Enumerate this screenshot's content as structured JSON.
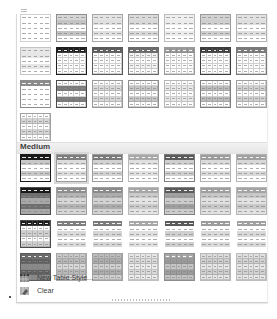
{
  "gallery": {
    "sections": [
      {
        "name": "Light",
        "label": "",
        "top": 0
      },
      {
        "name": "Medium",
        "label": "Medium",
        "top": 127
      }
    ],
    "light_rows": [
      [
        {
          "id": "light-1",
          "header": "#ffffff",
          "band": "#ffffff",
          "alt": "#ffffff",
          "border": "#d0d0d0",
          "bordered": false
        },
        {
          "id": "light-2",
          "header": "#d6d6d6",
          "band": "#c4c4c4",
          "alt": "#ffffff",
          "border": "#8c8c8c",
          "bordered": false
        },
        {
          "id": "light-3",
          "header": "#e4e4e4",
          "band": "#e0e0e0",
          "alt": "#ffffff",
          "border": "#a6a6a6",
          "bordered": false
        },
        {
          "id": "light-4",
          "header": "#dcdcdc",
          "band": "#d8d8d8",
          "alt": "#ffffff",
          "border": "#9a9a9a",
          "bordered": false
        },
        {
          "id": "light-5",
          "header": "#efefef",
          "band": "#ececec",
          "alt": "#ffffff",
          "border": "#bdbdbd",
          "bordered": false
        },
        {
          "id": "light-6",
          "header": "#d2d2d2",
          "band": "#cfcfcf",
          "alt": "#ffffff",
          "border": "#999999",
          "bordered": false
        },
        {
          "id": "light-7",
          "header": "#e2e2e2",
          "band": "#dedede",
          "alt": "#ffffff",
          "border": "#b0b0b0",
          "bordered": false
        }
      ],
      [
        {
          "id": "light-8",
          "header": "#e8e8e8",
          "band": "#e6e6e6",
          "alt": "#ffffff",
          "border": "#c4c4c4",
          "bordered": false
        },
        {
          "id": "light-9",
          "header": "#1e1e1e",
          "band": "#ffffff",
          "alt": "#ffffff",
          "border": "#1e1e1e",
          "bordered": true
        },
        {
          "id": "light-10",
          "header": "#5a5a5a",
          "band": "#ffffff",
          "alt": "#ffffff",
          "border": "#5a5a5a",
          "bordered": true
        },
        {
          "id": "light-11",
          "header": "#6a6a6a",
          "band": "#f3f3f3",
          "alt": "#ffffff",
          "border": "#6a6a6a",
          "bordered": true
        },
        {
          "id": "light-12",
          "header": "#9a9a9a",
          "band": "#ffffff",
          "alt": "#ffffff",
          "border": "#9a9a9a",
          "bordered": true
        },
        {
          "id": "light-13",
          "header": "#3c3c3c",
          "band": "#ffffff",
          "alt": "#ffffff",
          "border": "#3c3c3c",
          "bordered": true
        },
        {
          "id": "light-14",
          "header": "#7a7a7a",
          "band": "#ffffff",
          "alt": "#ffffff",
          "border": "#7a7a7a",
          "bordered": true
        }
      ],
      [
        {
          "id": "light-15",
          "header": "#8c8c8c",
          "band": "#ffffff",
          "alt": "#ffffff",
          "border": "#8c8c8c",
          "bordered": false
        },
        {
          "id": "light-16",
          "header": "#ffffff",
          "band": "#7c7c7c",
          "alt": "#ffffff",
          "border": "#4a4a4a",
          "bordered": true
        },
        {
          "id": "light-17",
          "header": "#ffffff",
          "band": "#d9d9d9",
          "alt": "#ffffff",
          "border": "#9a9a9a",
          "bordered": true
        },
        {
          "id": "light-18",
          "header": "#ffffff",
          "band": "#c8c8c8",
          "alt": "#ffffff",
          "border": "#8a8a8a",
          "bordered": true
        },
        {
          "id": "light-19",
          "header": "#ffffff",
          "band": "#e8e8e8",
          "alt": "#ffffff",
          "border": "#b5b5b5",
          "bordered": true
        },
        {
          "id": "light-20",
          "header": "#ffffff",
          "band": "#bdbdbd",
          "alt": "#ffffff",
          "border": "#7e7e7e",
          "bordered": true
        },
        {
          "id": "light-21",
          "header": "#ffffff",
          "band": "#d2d2d2",
          "alt": "#ffffff",
          "border": "#9e9e9e",
          "bordered": true
        }
      ],
      [
        {
          "id": "light-22",
          "header": "#ffffff",
          "band": "#d6d6d6",
          "alt": "#ffffff",
          "border": "#a0a0a0",
          "bordered": true
        }
      ]
    ],
    "medium_rows": [
      [
        {
          "id": "medium-1",
          "header": "#1a1a1a",
          "band": "#c8c8c8",
          "alt": "#ffffff",
          "border": "#1a1a1a",
          "bordered": false
        },
        {
          "id": "medium-2",
          "header": "#7e7e7e",
          "band": "#dcdcdc",
          "alt": "#ffffff",
          "border": "#9a9a9a",
          "bordered": false,
          "selected": true
        },
        {
          "id": "medium-3",
          "header": "#7a7a7a",
          "band": "#d2d2d2",
          "alt": "#ffffff",
          "border": "#9a9a9a",
          "bordered": false
        },
        {
          "id": "medium-4",
          "header": "#a8a8a8",
          "band": "#e0e0e0",
          "alt": "#ffffff",
          "border": "#b8b8b8",
          "bordered": false
        },
        {
          "id": "medium-5",
          "header": "#5a5a5a",
          "band": "#cfcfcf",
          "alt": "#ffffff",
          "border": "#7a7a7a",
          "bordered": false
        },
        {
          "id": "medium-6",
          "header": "#9c9c9c",
          "band": "#dadada",
          "alt": "#ffffff",
          "border": "#b0b0b0",
          "bordered": false
        },
        {
          "id": "medium-7",
          "header": "#a0a0a0",
          "band": "#d8d8d8",
          "alt": "#ffffff",
          "border": "#b4b4b4",
          "bordered": false
        }
      ],
      [
        {
          "id": "medium-8",
          "header": "#1a1a1a",
          "band": "#6e6e6e",
          "alt": "#a8a8a8",
          "border": "#4a4a4a",
          "bordered": false
        },
        {
          "id": "medium-9",
          "header": "#8e8e8e",
          "band": "#b4b4b4",
          "alt": "#d6d6d6",
          "border": "#a0a0a0",
          "bordered": false
        },
        {
          "id": "medium-10",
          "header": "#8a8a8a",
          "band": "#acacac",
          "alt": "#d2d2d2",
          "border": "#9c9c9c",
          "bordered": false
        },
        {
          "id": "medium-11",
          "header": "#a6a6a6",
          "band": "#cacaca",
          "alt": "#e4e4e4",
          "border": "#b8b8b8",
          "bordered": false
        },
        {
          "id": "medium-12",
          "header": "#5a5a5a",
          "band": "#a0a0a0",
          "alt": "#cccccc",
          "border": "#7e7e7e",
          "bordered": false
        },
        {
          "id": "medium-13",
          "header": "#9e9e9e",
          "band": "#c6c6c6",
          "alt": "#e0e0e0",
          "border": "#b2b2b2",
          "bordered": false
        },
        {
          "id": "medium-14",
          "header": "#a4a4a4",
          "band": "#c8c8c8",
          "alt": "#e2e2e2",
          "border": "#b6b6b6",
          "bordered": false
        }
      ],
      [
        {
          "id": "medium-15",
          "header": "#1a1a1a",
          "band": "#ffffff",
          "alt": "#d0d0d0",
          "border": "#4a4a4a",
          "bordered": true
        },
        {
          "id": "medium-16",
          "header": "#7e7e7e",
          "band": "#ffffff",
          "alt": "#dadada",
          "border": "#ffffff",
          "bordered": false
        },
        {
          "id": "medium-17",
          "header": "#7a7a7a",
          "band": "#ffffff",
          "alt": "#d6d6d6",
          "border": "#ffffff",
          "bordered": false
        },
        {
          "id": "medium-18",
          "header": "#a8a8a8",
          "band": "#ffffff",
          "alt": "#e0e0e0",
          "border": "#ffffff",
          "bordered": false
        },
        {
          "id": "medium-19",
          "header": "#5a5a5a",
          "band": "#ffffff",
          "alt": "#cfcfcf",
          "border": "#ffffff",
          "bordered": false
        },
        {
          "id": "medium-20",
          "header": "#9c9c9c",
          "band": "#ffffff",
          "alt": "#dadada",
          "border": "#ffffff",
          "bordered": false
        },
        {
          "id": "medium-21",
          "header": "#a0a0a0",
          "band": "#ffffff",
          "alt": "#d8d8d8",
          "border": "#ffffff",
          "bordered": false
        }
      ],
      [
        {
          "id": "medium-22",
          "header": "#6a6a6a",
          "band": "#5e5e5e",
          "alt": "#8a8a8a",
          "border": "#5a5a5a",
          "bordered": true
        },
        {
          "id": "medium-23",
          "header": "#c8c8c8",
          "band": "#b8b8b8",
          "alt": "#d8d8d8",
          "border": "#a8a8a8",
          "bordered": true
        },
        {
          "id": "medium-24",
          "header": "#bcbcbc",
          "band": "#acacac",
          "alt": "#d0d0d0",
          "border": "#a0a0a0",
          "bordered": true
        },
        {
          "id": "medium-25",
          "header": "#e6e6e6",
          "band": "#dadada",
          "alt": "#ececec",
          "border": "#c0c0c0",
          "bordered": true
        },
        {
          "id": "medium-26",
          "header": "#a8a8a8",
          "band": "#9c9c9c",
          "alt": "#c4c4c4",
          "border": "#8c8c8c",
          "bordered": true
        },
        {
          "id": "medium-27",
          "header": "#dcdcdc",
          "band": "#cecece",
          "alt": "#e6e6e6",
          "border": "#b8b8b8",
          "bordered": true
        },
        {
          "id": "medium-28",
          "header": "#e0e0e0",
          "band": "#d2d2d2",
          "alt": "#e8e8e8",
          "border": "#bcbcbc",
          "bordered": true
        }
      ]
    ]
  },
  "menu": {
    "new_table_style": {
      "label": "New Table Style...",
      "icon": "new-table-style-icon"
    },
    "clear": {
      "label": "Clear",
      "icon": "clear-eraser-icon"
    }
  }
}
